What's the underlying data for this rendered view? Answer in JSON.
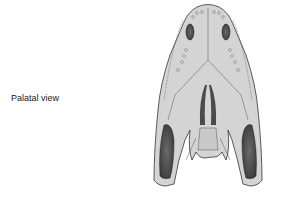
{
  "figure": {
    "label": "Palatal view"
  }
}
